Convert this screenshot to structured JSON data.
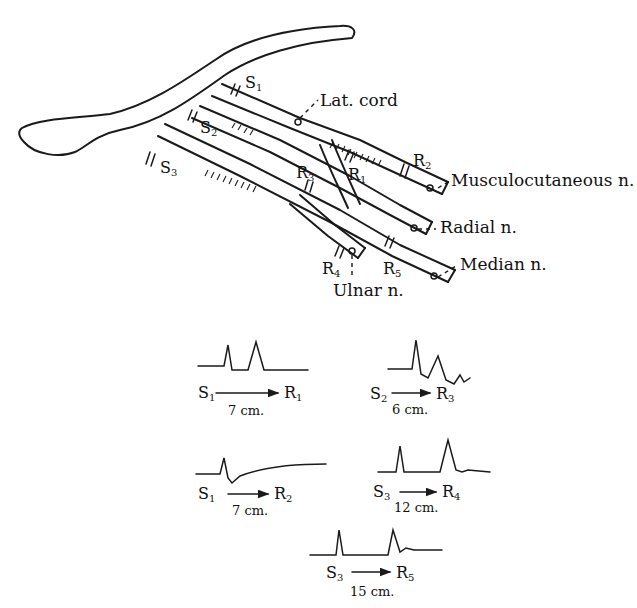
{
  "diagram": {
    "type": "anatomical nerve conduction diagram",
    "structures": {
      "clavicle": "clavicle",
      "lateral_cord": "Lat. cord",
      "nerves": [
        {
          "id": "musculocutaneous",
          "label": "Musculocutaneous n."
        },
        {
          "id": "radial",
          "label": "Radial n."
        },
        {
          "id": "median",
          "label": "Median n."
        },
        {
          "id": "ulnar",
          "label": "Ulnar n."
        }
      ]
    },
    "stimulation_points": [
      {
        "id": "S1",
        "letter": "S",
        "sub": "1"
      },
      {
        "id": "S2",
        "letter": "S",
        "sub": "2"
      },
      {
        "id": "S3",
        "letter": "S",
        "sub": "3"
      }
    ],
    "recording_points": [
      {
        "id": "R1",
        "letter": "R",
        "sub": "1"
      },
      {
        "id": "R2",
        "letter": "R",
        "sub": "2"
      },
      {
        "id": "R3",
        "letter": "R",
        "sub": "3"
      },
      {
        "id": "R4",
        "letter": "R",
        "sub": "4"
      },
      {
        "id": "R5",
        "letter": "R",
        "sub": "5"
      }
    ],
    "traces": [
      {
        "from": "S",
        "from_sub": "1",
        "to": "R",
        "to_sub": "1",
        "distance": "7 cm.",
        "shape": "stimulus artifact then single sharp peak"
      },
      {
        "from": "S",
        "from_sub": "2",
        "to": "R",
        "to_sub": "3",
        "distance": "6 cm.",
        "shape": "artifact then damped oscillations"
      },
      {
        "from": "S",
        "from_sub": "1",
        "to": "R",
        "to_sub": "2",
        "distance": "7 cm.",
        "shape": "artifact then slow rising baseline"
      },
      {
        "from": "S",
        "from_sub": "3",
        "to": "R",
        "to_sub": "4",
        "distance": "12 cm.",
        "shape": "artifact then tall peak"
      },
      {
        "from": "S",
        "from_sub": "3",
        "to": "R",
        "to_sub": "5",
        "distance": "15 cm.",
        "shape": "artifact then tall peak"
      }
    ]
  }
}
